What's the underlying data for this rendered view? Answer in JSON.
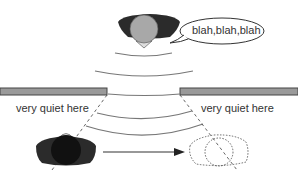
{
  "diagram": {
    "speech_bubble": {
      "text": "blah,blah,blah"
    },
    "labels": {
      "left": "very quiet here",
      "right": "very quiet here"
    },
    "elements": {
      "speaker": "person-top-speaking",
      "wall_left": "wall",
      "wall_right": "wall",
      "opening": "gap-in-wall",
      "sound_waves": 5,
      "listener": "person-bottom-left",
      "listener_moved": "person-bottom-right-dotted",
      "arrow": "movement-arrow"
    },
    "colors": {
      "body": "#2b2b2b",
      "head_top": "#a8a8a8",
      "head_bottom": "#111111",
      "wall_fill": "#9a9a9a",
      "wall_stroke": "#444444",
      "wave": "#777777",
      "dotted": "#555555"
    }
  }
}
